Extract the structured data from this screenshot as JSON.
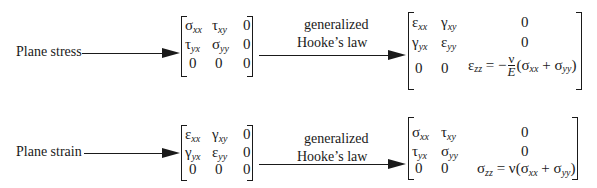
{
  "rows": [
    {
      "input_label": "Plane stress",
      "input_matrix": [
        [
          "σ",
          "xx",
          "τ",
          "xy",
          "0"
        ],
        [
          "τ",
          "yx",
          "σ",
          "yy",
          "0"
        ],
        [
          "0",
          "",
          "0",
          "",
          "0"
        ]
      ],
      "transform_label_line1": "generalized",
      "transform_label_line2": "Hooke’s law",
      "output_matrix": {
        "r1": {
          "c1": "ε",
          "c1s": "xx",
          "c2": "γ",
          "c2s": "xy",
          "c3": "0"
        },
        "r2": {
          "c1": "γ",
          "c1s": "yx",
          "c2": "ε",
          "c2s": "yy",
          "c3": "0"
        },
        "r3": {
          "c1": "0",
          "c2": "0",
          "c3_lhs": "ε",
          "c3_lhs_sub": "zz",
          "c3_eq": " = −",
          "frac_num": "ν",
          "frac_den": "E",
          "c3_rhs_open": "(σ",
          "c3_rhs_s1": "xx",
          "c3_plus": " + σ",
          "c3_rhs_s2": "yy",
          "c3_close": ")"
        }
      }
    },
    {
      "input_label": "Plane strain",
      "input_matrix": [
        [
          "ε",
          "xx",
          "γ",
          "xy",
          "0"
        ],
        [
          "γ",
          "yx",
          "ε",
          "yy",
          "0"
        ],
        [
          "0",
          "",
          "0",
          "",
          "0"
        ]
      ],
      "transform_label_line1": "generalized",
      "transform_label_line2": "Hooke’s law",
      "output_matrix": {
        "r1": {
          "c1": "σ",
          "c1s": "xx",
          "c2": "τ",
          "c2s": "xy",
          "c3": "0"
        },
        "r2": {
          "c1": "τ",
          "c1s": "yx",
          "c2": "σ",
          "c2s": "yy",
          "c3": "0"
        },
        "r3": {
          "c1": "0",
          "c2": "0",
          "c3_lhs": "σ",
          "c3_lhs_sub": "zz",
          "c3_eq": " = ν(σ",
          "c3_rhs_s1": "xx",
          "c3_plus": " + σ",
          "c3_rhs_s2": "yy",
          "c3_close": ")"
        }
      }
    }
  ]
}
